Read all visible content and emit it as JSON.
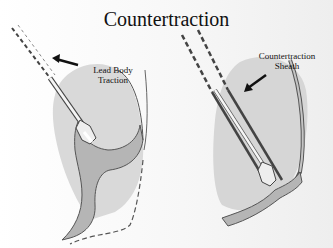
{
  "title": "Countertraction",
  "left_panel": {
    "label_line1": "Lead Body",
    "label_line2": "Traction"
  },
  "right_panel": {
    "label_line1": "Countertraction",
    "label_line2": "Sheath"
  },
  "colors": {
    "tissue_fill": "#b9b9b9",
    "heart_fill": "#d6d6d6",
    "outline": "#555555",
    "lead_dark": "#444444"
  }
}
